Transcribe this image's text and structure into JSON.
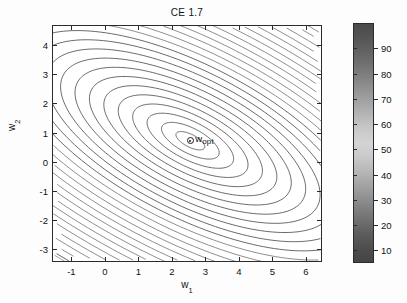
{
  "figure": {
    "title": "CE 1.7",
    "background_color": "#ffffff",
    "line_color": "#2b2b2b"
  },
  "axes": {
    "xlabel_main": "w",
    "xlabel_sub": "1",
    "ylabel_main": "w",
    "ylabel_sub": "2",
    "xticks": [
      "-1",
      "0",
      "1",
      "2",
      "3",
      "4",
      "5",
      "6"
    ],
    "yticks": [
      "4",
      "3",
      "2",
      "1",
      "0",
      "-1",
      "-2",
      "-3"
    ],
    "xlim": [
      -1.55,
      6.45
    ],
    "ylim": [
      -3.4,
      4.65
    ]
  },
  "annotation": {
    "marker_name": "w-opt-marker",
    "label_main": "w",
    "label_sub": "opt",
    "x": 2.55,
    "y": 0.72
  },
  "colorbar": {
    "ticks": [
      "90",
      "80",
      "70",
      "60",
      "50",
      "40",
      "30",
      "20",
      "10"
    ],
    "tick_values": [
      90,
      80,
      70,
      60,
      50,
      40,
      30,
      20,
      10
    ],
    "vmin": 5,
    "vmax": 100,
    "colormap": "grayscale-jet"
  },
  "chart_data": {
    "type": "contour",
    "title": "CE 1.7",
    "xlabel": "w_1",
    "ylabel": "w_2",
    "xlim": [
      -1.55,
      6.45
    ],
    "ylim": [
      -3.4,
      4.65
    ],
    "grid": false,
    "legend": false,
    "colorbar_range": [
      10,
      95
    ],
    "colorbar_ticks": [
      10,
      20,
      30,
      40,
      50,
      60,
      70,
      80,
      90
    ],
    "function": "elliptic_quadratic_bowl",
    "center": [
      2.55,
      0.72
    ],
    "rotation_deg": -32,
    "semi_axis_ratio": 2.35,
    "contour_levels": [
      2,
      5,
      9,
      14,
      20,
      27,
      35,
      44,
      54,
      65,
      77,
      90,
      104,
      119,
      135,
      152,
      170,
      189,
      209,
      230,
      252,
      275,
      299
    ]
  }
}
